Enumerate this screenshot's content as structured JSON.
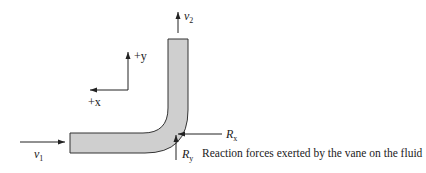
{
  "diagram": {
    "labels": {
      "v1": {
        "main": "v",
        "sub": "1"
      },
      "v2": {
        "main": "v",
        "sub": "2"
      },
      "plus_y": "+y",
      "plus_x": "+x",
      "rx": {
        "main": "R",
        "sub": "x"
      },
      "ry": {
        "main": "R",
        "sub": "y"
      },
      "caption": "Reaction forces exerted by the vane on the fluid"
    },
    "colors": {
      "vane_fill": "#cfcfcf",
      "vane_stroke": "#333333",
      "arrow": "#222222"
    }
  }
}
